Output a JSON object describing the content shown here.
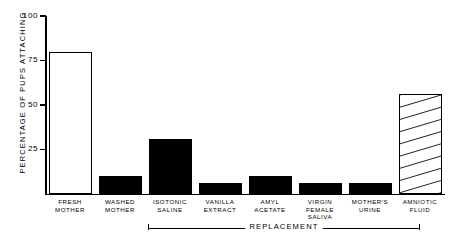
{
  "chart_data": {
    "type": "bar",
    "title": "",
    "xlabel": "REPLACEMENT",
    "ylabel": "PERCENTAGE OF PUPS ATTACHING",
    "ylim": [
      0,
      100
    ],
    "yticks": [
      0,
      25,
      50,
      75,
      100
    ],
    "ytick_labels": [
      "",
      "25",
      "50",
      "75",
      "100"
    ],
    "grid": false,
    "legend": "none",
    "categories": [
      "FRESH MOTHER",
      "WASHED MOTHER",
      "ISOTONIC SALINE",
      "VANILLA EXTRACT",
      "AMYL ACETATE",
      "VIRGIN FEMALE SALIVA",
      "MOTHER'S URINE",
      "AMNIOTIC FLUID"
    ],
    "values": [
      80,
      10,
      31,
      6,
      10,
      6,
      6,
      56
    ],
    "bar_styles": [
      "open",
      "solid",
      "solid",
      "solid",
      "solid",
      "solid",
      "solid",
      "hatched"
    ],
    "bars": [
      {
        "label_line1": "FRESH",
        "label_line2": "MOTHER",
        "label_line3": "",
        "value": 80,
        "style": "open"
      },
      {
        "label_line1": "WASHED",
        "label_line2": "MOTHER",
        "label_line3": "",
        "value": 10,
        "style": "solid"
      },
      {
        "label_line1": "ISOTONIC",
        "label_line2": "SALINE",
        "label_line3": "",
        "value": 31,
        "style": "solid"
      },
      {
        "label_line1": "VANILLA",
        "label_line2": "EXTRACT",
        "label_line3": "",
        "value": 6,
        "style": "solid"
      },
      {
        "label_line1": "AMYL",
        "label_line2": "ACETATE",
        "label_line3": "",
        "value": 10,
        "style": "solid"
      },
      {
        "label_line1": "VIRGIN",
        "label_line2": "FEMALE",
        "label_line3": "SALIVA",
        "value": 6,
        "style": "solid"
      },
      {
        "label_line1": "MOTHER'S",
        "label_line2": "URINE",
        "label_line3": "",
        "value": 6,
        "style": "solid"
      },
      {
        "label_line1": "AMNIOTIC",
        "label_line2": "FLUID",
        "label_line3": "",
        "value": 56,
        "style": "hatched"
      }
    ],
    "bracket": {
      "label": "REPLACEMENT",
      "covers_categories": [
        "ISOTONIC SALINE",
        "VANILLA EXTRACT",
        "AMYL ACETATE",
        "VIRGIN FEMALE SALIVA",
        "MOTHER'S URINE",
        "AMNIOTIC FLUID"
      ]
    },
    "colors": {
      "ink": "#000000",
      "background": "#ffffff"
    }
  }
}
